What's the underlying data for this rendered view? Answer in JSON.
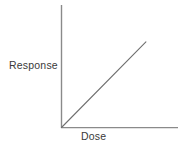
{
  "chart_data": {
    "type": "line",
    "title": "",
    "subtitle": "",
    "xlabel": "Dose",
    "ylabel": "Response",
    "x": [
      0,
      1
    ],
    "values": [
      0,
      1
    ],
    "series": [
      {
        "name": "dose-response",
        "x": [
          0,
          1
        ],
        "values": [
          0,
          1
        ]
      }
    ],
    "xlim": [
      0,
      1.38
    ],
    "ylim": [
      0,
      1.43
    ],
    "grid": false,
    "legend": null,
    "tick_labels": {
      "x": [],
      "y": []
    },
    "annotations": []
  },
  "figure": {
    "background_color": "#ffffff",
    "axis_color": "#8a8a8a",
    "line_color": "#6f6f6f",
    "label_color": "#3a3a3a"
  },
  "labels": {
    "y_axis": "Response",
    "x_axis": "Dose"
  }
}
